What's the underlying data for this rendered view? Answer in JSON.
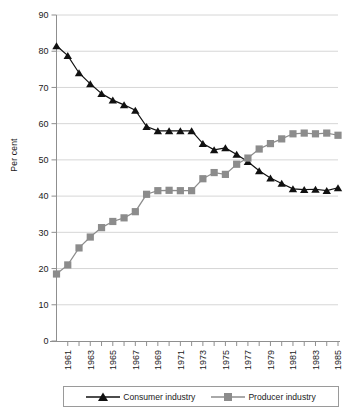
{
  "chart": {
    "type": "line",
    "ylabel": "Per cent",
    "title": "",
    "xlabel": ""
  },
  "axis": {
    "y_ticks": [
      "0",
      "10",
      "20",
      "30",
      "40",
      "50",
      "60",
      "70",
      "80",
      "90"
    ],
    "x_ticks": [
      "1961",
      "1963",
      "1965",
      "1967",
      "1969",
      "1971",
      "1973",
      "1975",
      "1977",
      "1979",
      "1981",
      "1983",
      "1985"
    ]
  },
  "legend": {
    "items": [
      {
        "label": "Consumer industry",
        "marker": "triangle-marker",
        "color": "#111111"
      },
      {
        "label": "Producer industry",
        "marker": "square-marker",
        "color": "#8c8c8c"
      }
    ]
  },
  "chart_data": {
    "type": "line",
    "title": "",
    "xlabel": "",
    "ylabel": "Per cent",
    "xlim": [
      1960,
      1985
    ],
    "ylim": [
      0,
      90
    ],
    "grid": true,
    "legend_position": "bottom",
    "x": [
      1960,
      1961,
      1962,
      1963,
      1964,
      1965,
      1966,
      1967,
      1968,
      1969,
      1970,
      1971,
      1972,
      1973,
      1974,
      1975,
      1976,
      1977,
      1978,
      1979,
      1980,
      1981,
      1982,
      1983,
      1984,
      1985
    ],
    "x_tick_labels": [
      "1961",
      "1963",
      "1965",
      "1967",
      "1969",
      "1971",
      "1973",
      "1975",
      "1977",
      "1979",
      "1981",
      "1983",
      "1985"
    ],
    "y_tick_labels": [
      "0",
      "10",
      "20",
      "30",
      "40",
      "50",
      "60",
      "70",
      "80",
      "90"
    ],
    "series": [
      {
        "name": "Consumer industry",
        "color": "#111111",
        "marker": "triangle",
        "values": [
          81.5,
          78.8,
          74.0,
          71.0,
          68.3,
          66.5,
          65.2,
          63.7,
          59.2,
          58.0,
          58.0,
          58.0,
          58.0,
          54.5,
          52.8,
          53.3,
          51.5,
          49.5,
          47.0,
          45.0,
          43.5,
          42.0,
          41.8,
          41.9,
          41.5,
          42.3
        ]
      },
      {
        "name": "Producer industry",
        "color": "#8c8c8c",
        "marker": "square",
        "values": [
          18.5,
          21.0,
          25.7,
          28.7,
          31.3,
          33.0,
          34.0,
          35.7,
          40.5,
          41.5,
          41.6,
          41.5,
          41.5,
          44.8,
          46.5,
          46.0,
          48.8,
          50.5,
          53.0,
          54.5,
          55.8,
          57.2,
          57.4,
          57.2,
          57.4,
          56.8
        ]
      }
    ]
  }
}
